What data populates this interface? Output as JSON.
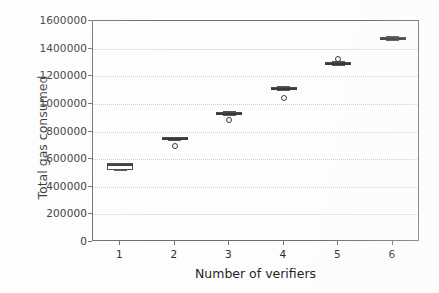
{
  "chart_data": {
    "type": "box",
    "title": "",
    "xlabel": "Number of verifiers",
    "ylabel": "Total gas consumed",
    "categories": [
      "1",
      "2",
      "3",
      "4",
      "5",
      "6"
    ],
    "xtick_labels": [
      "1",
      "2",
      "3",
      "4",
      "5",
      "6"
    ],
    "ytick_labels": [
      "0",
      "200000",
      "400000",
      "600000",
      "800000",
      "1000000",
      "1200000",
      "1400000",
      "1600000"
    ],
    "ytick_values": [
      0,
      200000,
      400000,
      600000,
      800000,
      1000000,
      1200000,
      1400000,
      1600000
    ],
    "ylim": [
      0,
      1600000
    ],
    "xlim": [
      0.5,
      6.5
    ],
    "grid": "horizontal-dotted",
    "legend": "none",
    "boxes": [
      {
        "category": "1",
        "q1": 520000,
        "median": 562000,
        "q3": 572000,
        "whisker_low": 520000,
        "whisker_high": 572000,
        "fliers": []
      },
      {
        "category": "2",
        "q1": 742000,
        "median": 752000,
        "q3": 757000,
        "whisker_low": 742000,
        "whisker_high": 757000,
        "fliers": [
          697000
        ]
      },
      {
        "category": "3",
        "q1": 925000,
        "median": 935000,
        "q3": 942000,
        "whisker_low": 918000,
        "whisker_high": 947000,
        "fliers": [
          882000
        ]
      },
      {
        "category": "4",
        "q1": 1108000,
        "median": 1118000,
        "q3": 1125000,
        "whisker_low": 1100000,
        "whisker_high": 1130000,
        "fliers": [
          1042000
        ]
      },
      {
        "category": "5",
        "q1": 1288000,
        "median": 1297000,
        "q3": 1303000,
        "whisker_low": 1280000,
        "whisker_high": 1308000,
        "fliers": [
          1325000
        ]
      },
      {
        "category": "6",
        "q1": 1468000,
        "median": 1478000,
        "q3": 1486000,
        "whisker_low": 1462000,
        "whisker_high": 1490000,
        "fliers": []
      }
    ],
    "colors": {
      "box_edge": "#4a4a4a",
      "median": "#3a3a3a",
      "whisker": "#555555",
      "flier_edge": "#3d3d3d",
      "grid": "#c9c9c9",
      "axis": "#6e6e6e",
      "background": "#fdfdfd",
      "text": "#1f1f1f"
    }
  }
}
